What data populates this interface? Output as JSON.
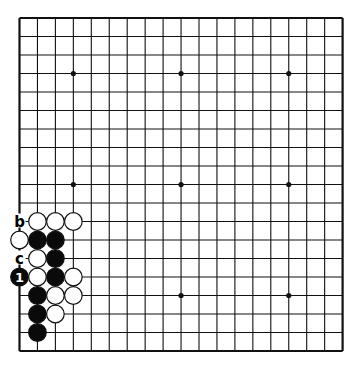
{
  "diagram": {
    "type": "go-board",
    "size": 19,
    "origin": {
      "x": 19.5,
      "y": 18
    },
    "spacing": {
      "x": 17.95,
      "y": 18.5
    },
    "line_color": "#111111",
    "hoshi": [
      [
        3,
        3
      ],
      [
        9,
        3
      ],
      [
        15,
        3
      ],
      [
        3,
        9
      ],
      [
        9,
        9
      ],
      [
        15,
        9
      ],
      [
        9,
        15
      ],
      [
        15,
        15
      ]
    ],
    "stones": [
      {
        "color": "white",
        "col": 1,
        "row": 11
      },
      {
        "color": "white",
        "col": 2,
        "row": 11
      },
      {
        "color": "white",
        "col": 3,
        "row": 11
      },
      {
        "color": "white",
        "col": 0,
        "row": 12
      },
      {
        "color": "black",
        "col": 1,
        "row": 12
      },
      {
        "color": "black",
        "col": 2,
        "row": 12
      },
      {
        "color": "white",
        "col": 1,
        "row": 13
      },
      {
        "color": "black",
        "col": 2,
        "row": 13
      },
      {
        "color": "black",
        "col": 0,
        "row": 14,
        "label": "1"
      },
      {
        "color": "white",
        "col": 1,
        "row": 14
      },
      {
        "color": "black",
        "col": 2,
        "row": 14
      },
      {
        "color": "white",
        "col": 3,
        "row": 14
      },
      {
        "color": "black",
        "col": 1,
        "row": 15
      },
      {
        "color": "white",
        "col": 2,
        "row": 15
      },
      {
        "color": "white",
        "col": 3,
        "row": 15
      },
      {
        "color": "black",
        "col": 1,
        "row": 16
      },
      {
        "color": "white",
        "col": 2,
        "row": 16
      },
      {
        "color": "black",
        "col": 1,
        "row": 17
      }
    ],
    "letters": [
      {
        "text": "b",
        "col": 0,
        "row": 11
      },
      {
        "text": "c",
        "col": 0,
        "row": 13
      }
    ]
  }
}
